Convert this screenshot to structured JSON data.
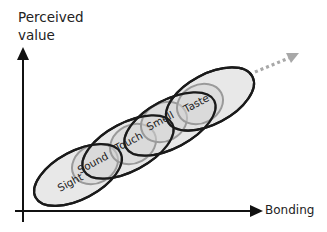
{
  "diagram": {
    "y_axis": {
      "label_line1": "Perceived",
      "label_line2": "value"
    },
    "x_axis": {
      "label": "Bonding"
    },
    "senses": [
      "Sight",
      "Sound",
      "Touch",
      "Smell",
      "Taste"
    ],
    "trend_arrow": "dotted-continuation-arrow",
    "colors": {
      "axis": "#111111",
      "big_ellipse_stroke": "#1a1a1a",
      "small_ellipse_stroke": "#9a9a9a",
      "fill": "#dedede",
      "dotted_arrow": "#a8a8a8",
      "text": "#222222"
    }
  }
}
